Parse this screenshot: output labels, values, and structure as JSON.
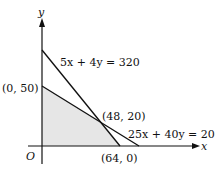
{
  "diagram": {
    "type": "linear-programming-feasible-region",
    "axes": {
      "x_label": "x",
      "y_label": "y",
      "origin_label": "O"
    },
    "lines": [
      {
        "id": "line1",
        "equation": "5x + 4y = 320",
        "y_intercept": [
          0,
          80
        ],
        "x_intercept": [
          64,
          0
        ]
      },
      {
        "id": "line2",
        "equation": "25x + 40y = 2000",
        "y_intercept": [
          0,
          50
        ],
        "x_intercept": [
          80,
          0
        ]
      }
    ],
    "points": [
      {
        "label": "(0, 50)",
        "coords": [
          0,
          50
        ]
      },
      {
        "label": "(48, 20)",
        "coords": [
          48,
          20
        ]
      },
      {
        "label": "(64, 0)",
        "coords": [
          64,
          0
        ]
      }
    ],
    "feasible_region": {
      "vertices": [
        [
          0,
          0
        ],
        [
          0,
          50
        ],
        [
          48,
          20
        ],
        [
          64,
          0
        ]
      ],
      "fill": "#e4e4e4"
    },
    "colors": {
      "line": "#111111",
      "shade": "#e4e4e4",
      "background": "#ffffff"
    }
  }
}
